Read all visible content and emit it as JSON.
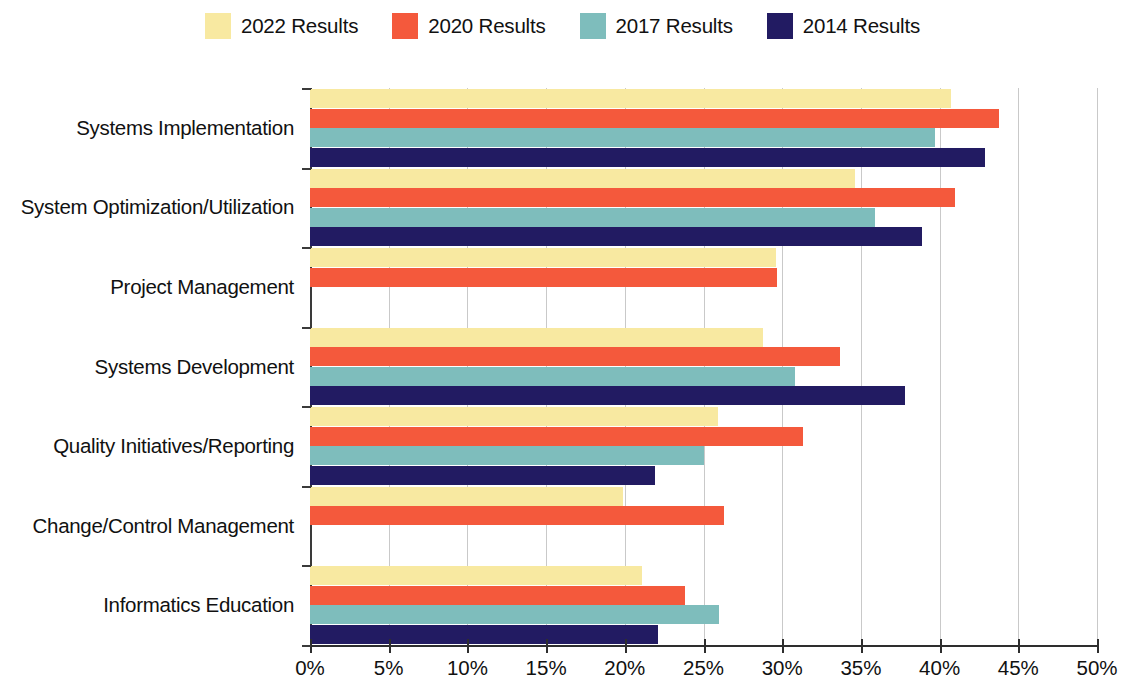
{
  "chart_data": {
    "type": "bar",
    "orientation": "horizontal",
    "title": "",
    "subtitle": "",
    "xlabel": "",
    "ylabel": "",
    "xlim": [
      0,
      50
    ],
    "xtick_values": [
      0,
      5,
      10,
      15,
      20,
      25,
      30,
      35,
      40,
      45,
      50
    ],
    "xtick_labels": [
      "0%",
      "5%",
      "10%",
      "15%",
      "20%",
      "25%",
      "30%",
      "35%",
      "40%",
      "45%",
      "50%"
    ],
    "grid": "vertical",
    "legend_position": "top-center",
    "value_suffix": "%",
    "categories": [
      "Systems Implementation",
      "System Optimization/Utilization",
      "Project Management",
      "Systems Development",
      "Quality Initiatives/Reporting",
      "Change/Control Management",
      "Informatics Education"
    ],
    "series": [
      {
        "name": "2022 Results",
        "color": "#F8E9A1",
        "values": [
          40.7,
          34.6,
          29.6,
          28.8,
          25.9,
          19.9,
          21.1
        ]
      },
      {
        "name": "2020 Results",
        "color": "#F4593C",
        "values": [
          43.8,
          41.0,
          29.7,
          33.7,
          31.3,
          26.3,
          23.8
        ]
      },
      {
        "name": "2017 Results",
        "color": "#7EBDBC",
        "values": [
          39.7,
          35.9,
          null,
          30.8,
          25.0,
          null,
          26.0
        ]
      },
      {
        "name": "2014 Results",
        "color": "#221B62",
        "values": [
          42.9,
          38.9,
          null,
          37.8,
          21.9,
          null,
          22.1
        ]
      }
    ]
  },
  "legend": {
    "items": [
      {
        "label": "2022 Results",
        "color": "#F8E9A1"
      },
      {
        "label": "2020 Results",
        "color": "#F4593C"
      },
      {
        "label": "2017 Results",
        "color": "#7EBDBC"
      },
      {
        "label": "2014 Results",
        "color": "#221B62"
      }
    ]
  },
  "axis": {
    "x_labels": [
      "0%",
      "5%",
      "10%",
      "15%",
      "20%",
      "25%",
      "30%",
      "35%",
      "40%",
      "45%",
      "50%"
    ],
    "y_labels": [
      "Systems Implementation",
      "System Optimization/Utilization",
      "Project Management",
      "Systems Development",
      "Quality Initiatives/Reporting",
      "Change/Control Management",
      "Informatics Education"
    ]
  }
}
